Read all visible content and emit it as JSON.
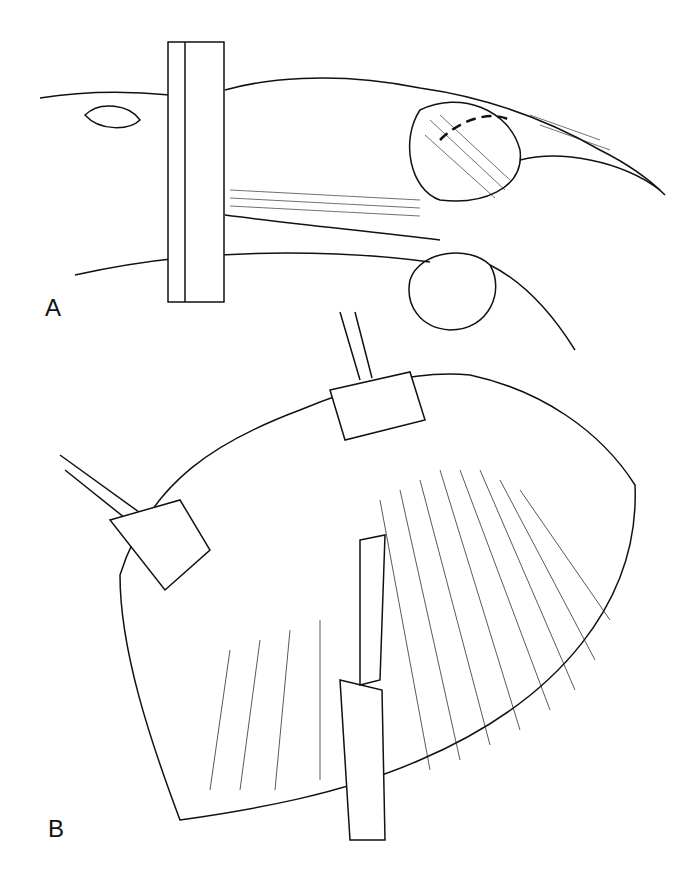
{
  "figure": {
    "panels": [
      {
        "label": "A",
        "description": "Patient positioned in lateral decubitus with marked incision line over the flank"
      },
      {
        "label": "B",
        "description": "Surgical exposure with retractors spreading muscle layers; scalpel blade incising"
      }
    ],
    "colors": {
      "ink": "#111111",
      "background": "#ffffff"
    }
  }
}
